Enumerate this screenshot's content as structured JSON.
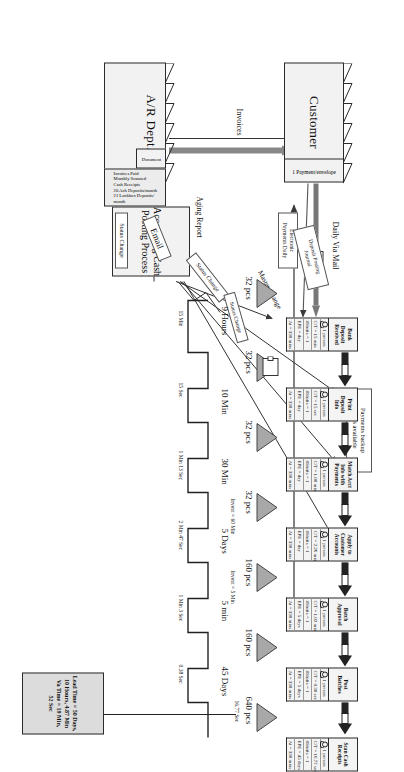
{
  "diagram": {
    "type": "value-stream-map"
  },
  "entities": {
    "customer": {
      "label": "Customer",
      "note": "1 Payment/envelope"
    },
    "ar_dept": {
      "label": "A/R Dept.",
      "doc_label": "Document",
      "notes": "Invoices Paid\nMonthly Scanned\nCash Receipts\n20 Ach Deposits/month\n21 Lockbox Deposits/\nmonth"
    },
    "control": {
      "label": "Accounting Cash\nPosting Process"
    }
  },
  "flow_labels": {
    "daily_via_mail": "Daily Via Mail",
    "electronic_payments": "Electronic\nPayments Daily",
    "aging_report": "Aging Report",
    "invoices": "Invoices",
    "email": "Email",
    "status_change_1": "Status Change",
    "status_change_2": "Status Change",
    "status_change_3": "Status Change",
    "master_change": "Master Change",
    "deposit_posting_journal": "Deposit Posting\nJournal",
    "payments_backup": "Payments backup\ndocs available"
  },
  "processes": [
    {
      "name": "Bank\nDeposit\nReceived",
      "operators": "1 person",
      "ct": "C/T = 15 min",
      "shifts": "#Shifts = 1",
      "epe": "EPE = day",
      "at": "At = 330 mins"
    },
    {
      "name": "Print\nDeposit\nInfo",
      "operators": "1 person",
      "ct": "C/T = 15 sec",
      "shifts": "#Shifts = 1",
      "epe": "EPE = day",
      "at": "At = 330 mins"
    },
    {
      "name": "Match Acct\nInfo with\nPayments",
      "operators": "1 person",
      "ct": "C/T = 1.08 min",
      "shifts": "#Shifts = 1",
      "epe": "EPE = day",
      "at": "At = 330 mins"
    },
    {
      "name": "Apply to\nCustomer\nAccounts",
      "operators": "1 person",
      "ct": "C/T = 2.26 min",
      "shifts": "#Shifts = 1",
      "epe": "EPE = day",
      "at": "At = 330 mins"
    },
    {
      "name": "Batch\nApproval",
      "operators": "1 person",
      "ct": "C/T = 1.02 min",
      "shifts": "#Shifts = 1",
      "epe": "EPE = 5 days",
      "at": "At = 330 mins"
    },
    {
      "name": "Post\nBatches",
      "operators": "1 person",
      "ct": "C/T = 0.38 sec",
      "shifts": "#Shifts = 1",
      "epe": "EPE = 5 days",
      "at": "At = 330 mins"
    },
    {
      "name": "Scan Cash\nReceipts",
      "operators": "1 person",
      "ct": "C/T = 16.77 sec",
      "shifts": "#Shifts = 1",
      "epe": "EPE = 45 days",
      "at": "At = 330 mins"
    }
  ],
  "inventory": [
    {
      "qty": "32 pcs"
    },
    {
      "qty": "32 pcs"
    },
    {
      "qty": "32 pcs"
    },
    {
      "qty": "32 pcs"
    },
    {
      "qty": "160 pcs"
    },
    {
      "qty": "160 pcs"
    },
    {
      "qty": "640 pcs"
    }
  ],
  "timeline": {
    "lead_times": [
      "9 Hours",
      "10 Min",
      "30 Min",
      "5 Days",
      "5 min",
      "45 Days"
    ],
    "va_times": [
      "15 Min",
      "15 Sec",
      "1 Min 13 Sec",
      "2 Min 47 Sec",
      "1 Min 3 Sec",
      "0.38 Sec",
      "16.77 Sec"
    ],
    "extra_va": [
      "Invent = 60 Min",
      "Invent = 5 Min"
    ]
  },
  "summary": {
    "text": "Lead Time = 50 Days,\n10 Hours, 4.87 Min\nVa Time = 19 Min,\n52 Sec"
  },
  "icons": {
    "operator": "operator-icon",
    "truck": "truck-icon",
    "document": "document-icon",
    "inventory": "inventory-triangle-icon",
    "push_arrow": "push-arrow-icon"
  },
  "colors": {
    "box_fill": "#f4f4f4",
    "summary_fill": "#dcdcdc",
    "line": "#3a3a3a",
    "tri_fill": "#a8a8a8"
  }
}
